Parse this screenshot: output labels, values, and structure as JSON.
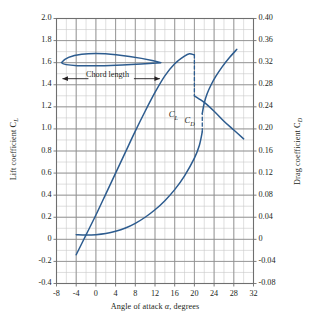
{
  "figure": {
    "background": "#ffffff",
    "curve_color": "#2d5c8f",
    "grid_major_color": "#8d8d8d",
    "grid_minor_color": "#c9c9c9",
    "frame_color": "#6f6f6f",
    "text_color": "#231f20"
  },
  "axes": {
    "left": {
      "title": "Lift coefficient C",
      "title_sub": "L",
      "ticks": [
        "2.0",
        "1.8",
        "1.6",
        "1.4",
        "1.2",
        "1.0",
        "0.8",
        "0.6",
        "0.4",
        "0.2",
        "0",
        "-0.2",
        "-0.4"
      ],
      "min": -0.4,
      "max": 2.0,
      "step": 0.2
    },
    "right": {
      "title": "Drag coefficient C",
      "title_sub": "D",
      "ticks": [
        "0.40",
        "0.36",
        "0.32",
        "0.28",
        "0.24",
        "0.20",
        "0.16",
        "0.12",
        "0.08",
        "0.04",
        "0",
        "-0.04",
        "-0.08"
      ],
      "min": -0.08,
      "max": 0.4,
      "step": 0.04
    },
    "bottom": {
      "title_a": "Angle of attack ",
      "title_sym": "α",
      "title_b": ", degrees",
      "ticks": [
        "-8",
        "-4",
        "0",
        "4",
        "8",
        "12",
        "16",
        "20",
        "24",
        "28",
        "32"
      ],
      "min": -8,
      "max": 32,
      "step": 4
    }
  },
  "annotations": {
    "chord_label": "Chord length",
    "cl_label": "C",
    "cl_label_sub": "L",
    "cd_label": "C",
    "cd_label_sub": "D"
  },
  "chart_data": {
    "type": "line",
    "title": "",
    "xlabel": "Angle of attack α, degrees",
    "ylabel": "Lift coefficient C_L",
    "y2label": "Drag coefficient C_D",
    "xlim": [
      -8,
      32
    ],
    "ylim": [
      -0.4,
      2.0
    ],
    "y2lim": [
      -0.08,
      0.4
    ],
    "grid": true,
    "grid_minor": true,
    "legend": "inline-labels",
    "series": [
      {
        "name": "C_L",
        "axis": "left",
        "label": "C_L",
        "label_x": 15.2,
        "label_y": 1.13,
        "style": "solid",
        "points": [
          [
            -4.0,
            -0.14
          ],
          [
            -2.0,
            0.04
          ],
          [
            0.0,
            0.22
          ],
          [
            2.0,
            0.41
          ],
          [
            4.0,
            0.6
          ],
          [
            6.0,
            0.79
          ],
          [
            8.0,
            0.98
          ],
          [
            10.0,
            1.16
          ],
          [
            12.0,
            1.33
          ],
          [
            14.0,
            1.48
          ],
          [
            16.0,
            1.59
          ],
          [
            18.0,
            1.66
          ],
          [
            19.0,
            1.68
          ],
          [
            20.0,
            1.67
          ]
        ]
      },
      {
        "name": "C_L post-stall",
        "axis": "left",
        "label": "",
        "style": "solid",
        "points": [
          [
            20.0,
            1.3
          ],
          [
            22.0,
            1.24
          ],
          [
            24.0,
            1.16
          ],
          [
            26.0,
            1.07
          ],
          [
            28.0,
            0.99
          ],
          [
            30.0,
            0.91
          ]
        ]
      },
      {
        "name": "C_L stall drop",
        "axis": "left",
        "label": "",
        "style": "dashed",
        "points": [
          [
            20.0,
            1.67
          ],
          [
            20.0,
            1.3
          ]
        ]
      },
      {
        "name": "C_D",
        "axis": "right",
        "label": "C_D",
        "label_x": 18.4,
        "label_y": 0.214,
        "style": "solid",
        "points": [
          [
            -4.0,
            0.0085
          ],
          [
            -2.0,
            0.008
          ],
          [
            0.0,
            0.0085
          ],
          [
            2.0,
            0.0105
          ],
          [
            4.0,
            0.0145
          ],
          [
            6.0,
            0.0205
          ],
          [
            8.0,
            0.029
          ],
          [
            10.0,
            0.04
          ],
          [
            12.0,
            0.0535
          ],
          [
            14.0,
            0.07
          ],
          [
            16.0,
            0.09
          ],
          [
            18.0,
            0.115
          ],
          [
            20.0,
            0.147
          ],
          [
            21.0,
            0.17
          ],
          [
            21.6,
            0.195
          ]
        ]
      },
      {
        "name": "C_D post-stall",
        "axis": "right",
        "label": "",
        "style": "solid",
        "points": [
          [
            21.6,
            0.228
          ],
          [
            22.0,
            0.247
          ],
          [
            22.6,
            0.264
          ],
          [
            23.4,
            0.28
          ],
          [
            24.4,
            0.296
          ],
          [
            25.6,
            0.312
          ],
          [
            27.0,
            0.328
          ],
          [
            28.6,
            0.344
          ]
        ]
      },
      {
        "name": "C_D stall jump",
        "axis": "right",
        "label": "",
        "style": "dashed",
        "points": [
          [
            21.6,
            0.195
          ],
          [
            21.6,
            0.228
          ]
        ]
      }
    ],
    "airfoil_annotation": {
      "label": "Chord length",
      "leading_edge_x": -7.0,
      "trailing_edge_x": 13.2,
      "chord_y": 1.6,
      "arrow_y": 1.455
    }
  }
}
